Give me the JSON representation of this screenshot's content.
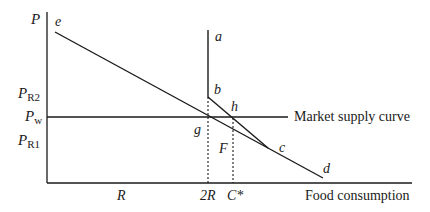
{
  "diagram": {
    "axes": {
      "y_label": "P",
      "x_label": "Food consumption",
      "y_ticks": [
        {
          "main": "P",
          "sub": "R2"
        },
        {
          "main": "P",
          "sub": "w"
        },
        {
          "main": "P",
          "sub": "R1"
        }
      ],
      "x_ticks": [
        "R",
        "2R",
        "C*"
      ]
    },
    "points": {
      "a": "a",
      "b": "b",
      "c": "c",
      "d": "d",
      "e": "e",
      "g": "g",
      "h": "h"
    },
    "region_label": "F",
    "supply_curve_label": "Market supply curve",
    "colors": {
      "line": "#1a1a1a",
      "background": "#ffffff"
    }
  }
}
